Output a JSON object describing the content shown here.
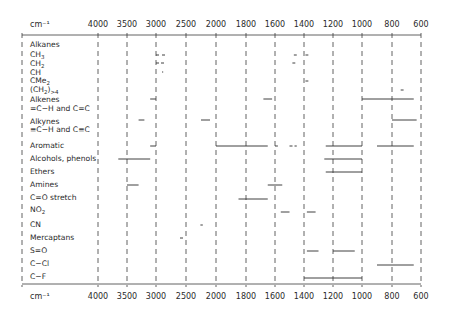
{
  "chart_data": {
    "type": "range-bar",
    "title": "",
    "xlabel": "cm⁻¹",
    "unit_label": "cm⁻¹",
    "ticks": [
      4000,
      3500,
      3000,
      2500,
      2000,
      1800,
      1600,
      1400,
      1200,
      1000,
      800,
      600
    ],
    "tick_px": [
      98,
      127,
      156,
      186,
      216,
      246,
      275,
      304,
      333,
      362,
      392,
      421
    ],
    "axis_note": "non-linear wavenumber scale; 500 cm⁻¹ per division above 2000, 200 cm⁻¹ per division below",
    "grid": "dashed vertical lines at each tick",
    "rows": [
      {
        "label": "Alkanes",
        "y": 45,
        "ranges": []
      },
      {
        "label": "CH3",
        "display": "CH₃",
        "y": 55,
        "ranges": [
          [
            3000,
            2950,
            "dashed"
          ],
          [
            2900,
            2850,
            "dashed"
          ],
          [
            1470,
            1450
          ],
          [
            1390,
            1370
          ]
        ]
      },
      {
        "label": "CH2",
        "display": "CH₂",
        "y": 63,
        "ranges": [
          [
            3000,
            2840,
            "dashed"
          ],
          [
            1480,
            1460
          ]
        ]
      },
      {
        "label": "CH",
        "y": 72,
        "ranges": [
          [
            2900,
            2880
          ]
        ]
      },
      {
        "label": "CMe2",
        "display": "CMe₂",
        "y": 81,
        "ranges": [
          [
            1390,
            1370
          ]
        ]
      },
      {
        "label": "(CH2)>4",
        "display": "(CH₂)ₙ>4",
        "y": 90,
        "ranges": [
          [
            740,
            720
          ]
        ]
      },
      {
        "label": "Alkenes",
        "y": 99,
        "ranges": [
          [
            3100,
            3000
          ],
          [
            1680,
            1620
          ],
          [
            1000,
            650
          ]
        ]
      },
      {
        "label": "=C-H and C=C",
        "y": 106,
        "ranges": []
      },
      {
        "label": "Alkynes",
        "y": 120,
        "ranges": [
          [
            3300,
            3200
          ],
          [
            2250,
            2100
          ],
          [
            800,
            630
          ]
        ]
      },
      {
        "label": "≡C-H and C≡C",
        "y": 128,
        "ranges": []
      },
      {
        "label": "Aromatic",
        "y": 146,
        "ranges": [
          [
            3100,
            3000
          ],
          [
            2000,
            1650
          ],
          [
            1600,
            1580,
            "dashed"
          ],
          [
            1500,
            1450,
            "dashed"
          ],
          [
            1250,
            1000
          ],
          [
            900,
            650
          ]
        ]
      },
      {
        "label": "Alcohols, phenols",
        "y": 159,
        "ranges": [
          [
            3650,
            3100
          ],
          [
            1260,
            1000
          ]
        ]
      },
      {
        "label": "Ethers",
        "y": 172,
        "ranges": [
          [
            1250,
            1000
          ]
        ]
      },
      {
        "label": "Amines",
        "y": 185,
        "ranges": [
          [
            3500,
            3300
          ],
          [
            1650,
            1550
          ]
        ]
      },
      {
        "label": "C=O stretch",
        "y": 199,
        "ranges": [
          [
            1850,
            1650
          ]
        ]
      },
      {
        "label": "NO2",
        "display": "NO₂",
        "y": 212,
        "ranges": [
          [
            1560,
            1500
          ],
          [
            1380,
            1320
          ]
        ]
      },
      {
        "label": "CN",
        "y": 225,
        "ranges": [
          [
            2260,
            2220
          ]
        ]
      },
      {
        "label": "Mercaptans",
        "y": 238,
        "ranges": [
          [
            2600,
            2550
          ]
        ]
      },
      {
        "label": "S=O",
        "y": 251,
        "ranges": [
          [
            1380,
            1300
          ],
          [
            1200,
            1050
          ]
        ]
      },
      {
        "label": "C-Cl",
        "y": 265,
        "ranges": [
          [
            900,
            650
          ]
        ]
      },
      {
        "label": "C-F",
        "y": 278,
        "ranges": [
          [
            1400,
            1000
          ]
        ]
      }
    ]
  },
  "header": {
    "unit_label": "cm⁻¹"
  },
  "footer": {
    "unit_label": "cm⁻¹"
  },
  "labels": {
    "alkanes": "Alkanes",
    "ch3_main": "CH",
    "ch3_sub": "3",
    "ch2_main": "CH",
    "ch2_sub": "2",
    "ch": "CH",
    "cme2_main": "CMe",
    "cme2_sub": "2",
    "chn_main": "(CH",
    "chn_sub": "2",
    "chn_tail": ")",
    "chn_sub2": ">4",
    "alkenes": "Alkenes",
    "alkenes_sub": "=C−H and C=C",
    "alkynes": "Alkynes",
    "alkynes_sub": "≡C−H and C≡C",
    "aromatic": "Aromatic",
    "alcohols": "Alcohols, phenols",
    "ethers": "Ethers",
    "amines": "Amines",
    "co": "C=O stretch",
    "no2_main": "NO",
    "no2_sub": "2",
    "cn": "CN",
    "mercaptans": "Mercaptans",
    "so": "S=O",
    "ccl": "C−Cl",
    "cf": "C−F"
  },
  "colors": {
    "ink": "#2a2a2a",
    "grid": "#3a3a3a",
    "background": "#ffffff"
  }
}
